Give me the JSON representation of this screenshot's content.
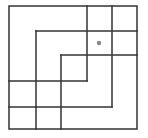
{
  "diagram": {
    "stroke_color": "#333333",
    "stroke_width": 1.5,
    "dot_color": "#888888",
    "outer_square": {
      "x1": 9,
      "y1": 6,
      "x2": 137,
      "y2": 129
    },
    "lines": [
      {
        "id": "v-87",
        "x1": 87,
        "y1": 6,
        "x2": 87,
        "y2": 81
      },
      {
        "id": "h-81",
        "x1": 9,
        "y1": 81,
        "x2": 87,
        "y2": 81
      },
      {
        "id": "v-112",
        "x1": 112,
        "y1": 6,
        "x2": 112,
        "y2": 107
      },
      {
        "id": "h-107",
        "x1": 9,
        "y1": 107,
        "x2": 112,
        "y2": 107
      },
      {
        "id": "h-31",
        "x1": 36,
        "y1": 31,
        "x2": 137,
        "y2": 31
      },
      {
        "id": "v-36",
        "x1": 36,
        "y1": 31,
        "x2": 36,
        "y2": 129
      },
      {
        "id": "h-55",
        "x1": 61,
        "y1": 55,
        "x2": 137,
        "y2": 55
      },
      {
        "id": "v-61",
        "x1": 61,
        "y1": 55,
        "x2": 61,
        "y2": 129
      }
    ],
    "dot": {
      "cx": 99,
      "cy": 43,
      "r": 2.2
    }
  }
}
